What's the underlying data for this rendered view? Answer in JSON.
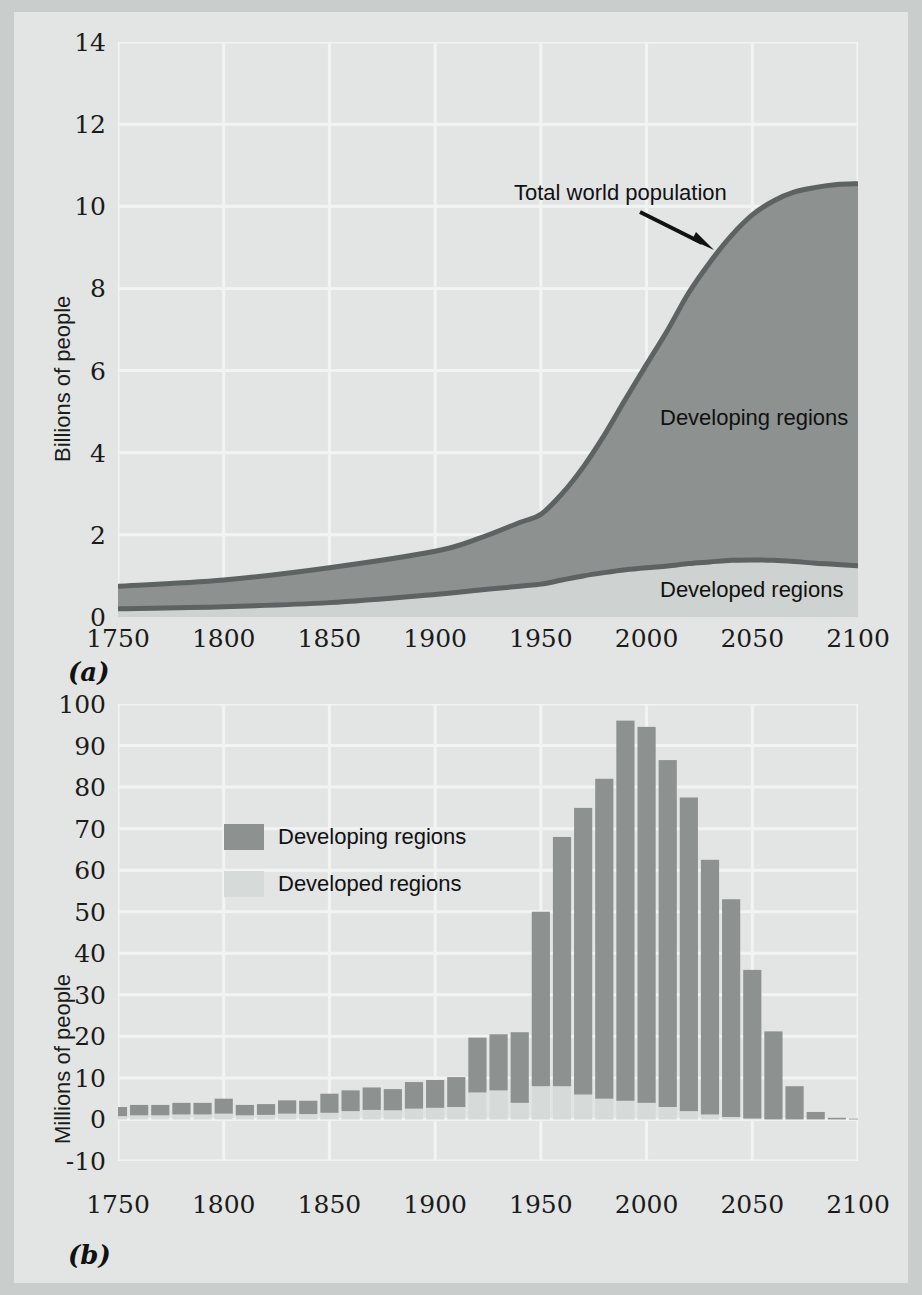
{
  "figure": {
    "background": "#e3e5e4",
    "frame": "#c9cdcc",
    "developing_color": "#8d9190",
    "developed_color": "#ced2d1",
    "line_color": "#5d6362",
    "grid_color": "#f2f4f3",
    "text_color": "#1b1b1b"
  },
  "panel_a": {
    "label": "(a)",
    "ylabel": "Billions of people",
    "yticks": [
      "14",
      "12",
      "10",
      "8",
      "6",
      "4",
      "2",
      "0"
    ],
    "xticks": [
      "1750",
      "1800",
      "1850",
      "1900",
      "1950",
      "2000",
      "2050",
      "2100"
    ],
    "annotation": "Total world population",
    "label_developing": "Developing regions",
    "label_developed": "Developed regions"
  },
  "panel_b": {
    "label": "(b)",
    "ylabel": "Millions of people",
    "yticks": [
      "100",
      "90",
      "80",
      "70",
      "60",
      "50",
      "40",
      "30",
      "20",
      "10",
      "0",
      "-10"
    ],
    "xticks": [
      "1750",
      "1800",
      "1850",
      "1900",
      "1950",
      "2000",
      "2050",
      "2100"
    ],
    "legend": [
      {
        "name": "Developing regions",
        "color": "#8d9190"
      },
      {
        "name": "Developed regions",
        "color": "#ced2d1"
      }
    ]
  },
  "chart_data": [
    {
      "type": "area",
      "panel": "(a)",
      "title": "",
      "xlabel": "",
      "ylabel": "Billions of people",
      "xlim": [
        1750,
        2100
      ],
      "ylim": [
        0,
        14
      ],
      "ytick_values": [
        0,
        2,
        4,
        6,
        8,
        10,
        12,
        14
      ],
      "xtick_values": [
        1750,
        1800,
        1850,
        1900,
        1950,
        2000,
        2050,
        2100
      ],
      "grid": true,
      "stacked": true,
      "legend_position": "inline-annotation",
      "annotations": [
        {
          "text": "Total world population",
          "points_to_year": 2012,
          "points_to_value": 9.0
        },
        {
          "text": "Developing regions",
          "year": 2040,
          "value": 5.2
        },
        {
          "text": "Developed regions",
          "year": 2060,
          "value": 0.7
        }
      ],
      "x": [
        1750,
        1800,
        1850,
        1900,
        1920,
        1940,
        1950,
        1960,
        1970,
        1980,
        1990,
        2000,
        2010,
        2020,
        2030,
        2040,
        2050,
        2060,
        2070,
        2080,
        2090,
        2100
      ],
      "series": [
        {
          "name": "Developed regions",
          "values": [
            0.2,
            0.25,
            0.35,
            0.55,
            0.65,
            0.75,
            0.8,
            0.9,
            1.0,
            1.08,
            1.15,
            1.2,
            1.24,
            1.3,
            1.34,
            1.38,
            1.39,
            1.38,
            1.35,
            1.31,
            1.28,
            1.25
          ]
        },
        {
          "name": "Developing regions",
          "values": [
            0.55,
            0.65,
            0.85,
            1.05,
            1.25,
            1.55,
            1.7,
            2.1,
            2.65,
            3.35,
            4.15,
            4.95,
            5.75,
            6.6,
            7.3,
            7.9,
            8.4,
            8.75,
            9.0,
            9.15,
            9.25,
            9.3
          ]
        }
      ],
      "total_world_population": [
        0.75,
        0.9,
        1.2,
        1.6,
        1.9,
        2.3,
        2.5,
        3.0,
        3.65,
        4.43,
        5.3,
        6.15,
        6.99,
        7.9,
        8.64,
        9.28,
        9.79,
        10.13,
        10.35,
        10.46,
        10.53,
        10.55
      ]
    },
    {
      "type": "bar",
      "panel": "(b)",
      "title": "",
      "xlabel": "",
      "ylabel": "Millions of people",
      "xlim": [
        1750,
        2100
      ],
      "ylim": [
        -10,
        100
      ],
      "ytick_values": [
        -10,
        0,
        10,
        20,
        30,
        40,
        50,
        60,
        70,
        80,
        90,
        100
      ],
      "xtick_values": [
        1750,
        1800,
        1850,
        1900,
        1950,
        2000,
        2050,
        2100
      ],
      "grid": true,
      "stacked": true,
      "legend_position": "upper-left-inside",
      "categories": [
        1750,
        1760,
        1770,
        1780,
        1790,
        1800,
        1810,
        1820,
        1830,
        1840,
        1850,
        1860,
        1870,
        1880,
        1890,
        1900,
        1910,
        1920,
        1930,
        1940,
        1950,
        1960,
        1970,
        1980,
        1990,
        2000,
        2010,
        2020,
        2030,
        2040,
        2050,
        2060,
        2070,
        2080,
        2090,
        2100
      ],
      "series": [
        {
          "name": "Developed regions",
          "values": [
            0.8,
            1.0,
            1.0,
            1.2,
            1.2,
            1.4,
            1.0,
            1.1,
            1.4,
            1.3,
            1.6,
            2.0,
            2.3,
            2.2,
            2.6,
            2.8,
            3.0,
            6.5,
            7.0,
            4.0,
            8.0,
            8.0,
            6.0,
            5.0,
            4.5,
            4.0,
            3.0,
            2.0,
            1.2,
            0.6,
            0.2,
            0.0,
            0.0,
            0.0,
            0.0,
            0.0
          ]
        },
        {
          "name": "Developing regions",
          "values": [
            2.2,
            2.5,
            2.5,
            2.8,
            2.8,
            3.6,
            2.5,
            2.6,
            3.2,
            3.2,
            4.6,
            5.0,
            5.4,
            5.1,
            6.4,
            6.7,
            7.2,
            13.2,
            13.5,
            17.0,
            42.0,
            60.0,
            69.0,
            77.0,
            91.5,
            90.5,
            83.5,
            75.5,
            61.3,
            52.4,
            35.8,
            21.2,
            8.0,
            1.8,
            0.4,
            0.2
          ]
        }
      ],
      "totals": [
        3,
        3.5,
        3.5,
        4,
        4,
        5,
        3.5,
        3.7,
        4.6,
        4.5,
        6.2,
        7,
        7.7,
        7.3,
        9,
        9.5,
        10.2,
        19.7,
        20.5,
        21,
        50,
        68,
        75,
        82,
        96,
        94.5,
        86.5,
        77.5,
        62.5,
        53,
        36,
        21.2,
        8,
        1.8,
        0.4,
        0.2
      ]
    }
  ]
}
